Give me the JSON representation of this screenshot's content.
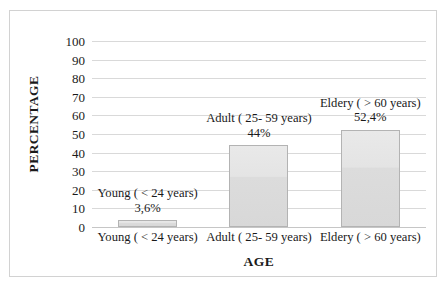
{
  "chart_data": {
    "type": "bar",
    "title": "",
    "xlabel": "AGE",
    "ylabel": "PERCENTAGE",
    "categories": [
      "Young ( < 24 years)",
      "Adult ( 25- 59 years)",
      "Eldery ( > 60 years)"
    ],
    "values": [
      3.6,
      44,
      52.4
    ],
    "value_labels": [
      "3,6%",
      "44%",
      "52,4%"
    ],
    "ylim": [
      0,
      100
    ],
    "y_ticks": [
      0,
      10,
      20,
      30,
      40,
      50,
      60,
      70,
      80,
      90,
      100
    ],
    "y_tick_labels": [
      "0",
      "10",
      "20",
      "30",
      "40",
      "50",
      "60",
      "70",
      "80",
      "90",
      "100"
    ],
    "grid": true,
    "legend": "none",
    "series": [
      {
        "name": "Percentage",
        "values": [
          3.6,
          44,
          52.4
        ]
      }
    ],
    "annotations": [
      {
        "text": "Young ( < 24 years)",
        "value_text": "3,6%",
        "category": "Young ( < 24 years)"
      },
      {
        "text": "Adult ( 25- 59 years)",
        "value_text": "44%",
        "category": "Adult ( 25- 59 years)"
      },
      {
        "text": "Eldery ( > 60 years)",
        "value_text": "52,4%",
        "category": "Eldery ( > 60 years)"
      }
    ],
    "colors": {
      "bar_fill": "#e4e4e4",
      "bar_border": "#b3b3b3",
      "gridline": "#d9d9d9",
      "text": "#1a1a1a",
      "frame": "#d2d2d2",
      "background": "#ffffff"
    }
  }
}
